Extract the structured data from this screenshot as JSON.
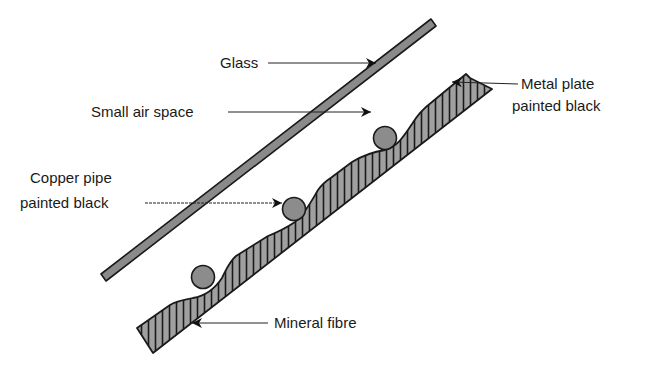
{
  "diagram": {
    "type": "solar-collector-cross-section",
    "labels": {
      "glass": "Glass",
      "air_space": "Small air space",
      "metal_plate_line1": "Metal plate",
      "metal_plate_line2": "painted black",
      "copper_pipe_line1": "Copper pipe",
      "copper_pipe_line2": "painted black",
      "mineral_fibre": "Mineral fibre"
    },
    "components": [
      {
        "name": "glass",
        "fill": "#8a8a8a"
      },
      {
        "name": "air-space"
      },
      {
        "name": "metal-plate",
        "fill": "#9a9a9a",
        "hatch": "vertical"
      },
      {
        "name": "copper-pipe",
        "count": 3,
        "fill": "#8c8c8c"
      },
      {
        "name": "mineral-fibre"
      }
    ],
    "colors": {
      "outline": "#1a1a1a",
      "glass_fill": "#8a8a8a",
      "pipe_fill": "#8c8c8c",
      "plate_fill": "#a0a0a0",
      "background": "#ffffff"
    }
  }
}
